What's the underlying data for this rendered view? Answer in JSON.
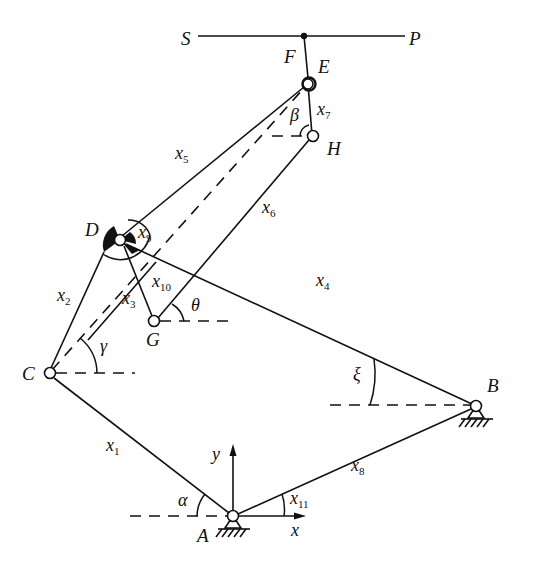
{
  "figure": {
    "type": "planar linkage mechanism diagram",
    "points": {
      "S": "S",
      "P": "P",
      "F": "F",
      "E": "E",
      "H": "H",
      "D": "D",
      "G": "G",
      "C": "C",
      "B": "B",
      "A": "A"
    },
    "links": {
      "x1": {
        "base": "x",
        "sub": "1"
      },
      "x2": {
        "base": "x",
        "sub": "2"
      },
      "x3": {
        "base": "x",
        "sub": "3"
      },
      "x4": {
        "base": "x",
        "sub": "4"
      },
      "x5": {
        "base": "x",
        "sub": "5"
      },
      "x6": {
        "base": "x",
        "sub": "6"
      },
      "x7": {
        "base": "x",
        "sub": "7"
      },
      "x8": {
        "base": "x",
        "sub": "8"
      },
      "x9": {
        "base": "x",
        "sub": "9"
      },
      "x10": {
        "base": "x",
        "sub": "10"
      },
      "x11": {
        "base": "x",
        "sub": "11"
      }
    },
    "angles": {
      "alpha": "α",
      "beta": "β",
      "gamma": "γ",
      "theta": "θ",
      "xi": "ξ"
    },
    "axes": {
      "x": "x",
      "y": "y"
    }
  }
}
